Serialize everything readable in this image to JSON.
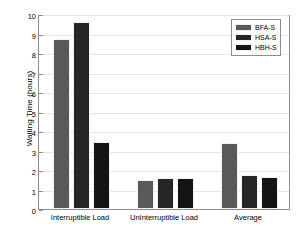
{
  "chart_data": {
    "type": "bar",
    "title": "",
    "xlabel": "",
    "ylabel": "Waiting Time (hours)",
    "categories": [
      "Interruptible Load",
      "UnInterruptible Load",
      "Average"
    ],
    "series": [
      {
        "name": "BFA-S",
        "color": "#595959",
        "values": [
          8.72,
          1.48,
          3.38
        ]
      },
      {
        "name": "HSA-S",
        "color": "#262626",
        "values": [
          9.6,
          1.6,
          1.75
        ]
      },
      {
        "name": "HBH-S",
        "color": "#141414",
        "values": [
          3.45,
          1.58,
          1.65
        ]
      }
    ],
    "ylim": [
      0,
      10
    ],
    "yticks": [
      "0",
      "1",
      "2",
      "3",
      "4",
      "5",
      "6",
      "7",
      "8",
      "9",
      "10"
    ],
    "grid": true,
    "legend_position": "top-right"
  }
}
